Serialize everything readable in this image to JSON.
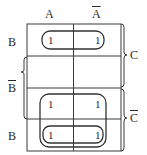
{
  "diagram": {
    "type": "karnaugh-map",
    "columns": [
      {
        "label": "A",
        "negated": false
      },
      {
        "label": "A",
        "negated": true
      }
    ],
    "rows": [
      {
        "label": "B",
        "negated": false
      },
      {
        "label": "B",
        "negated": true
      },
      {
        "label": "",
        "negated": false
      },
      {
        "label": "B",
        "negated": false
      }
    ],
    "row_brackets": [
      {
        "side": "left",
        "label": "B",
        "negated": true,
        "rows": [
          1,
          2
        ]
      },
      {
        "side": "right",
        "label": "C",
        "negated": false,
        "rows": [
          0,
          1
        ]
      },
      {
        "side": "right",
        "label": "C",
        "negated": true,
        "rows": [
          2,
          3
        ]
      }
    ],
    "cells": [
      [
        "1",
        "1"
      ],
      [
        "",
        ""
      ],
      [
        "1",
        "1"
      ],
      [
        "1",
        "1"
      ]
    ],
    "groupings": [
      {
        "name": "row-0-pair",
        "cells": [
          [
            0,
            0
          ],
          [
            0,
            1
          ]
        ]
      },
      {
        "name": "rows-2-3-quad",
        "cells": [
          [
            2,
            0
          ],
          [
            2,
            1
          ],
          [
            3,
            0
          ],
          [
            3,
            1
          ]
        ]
      },
      {
        "name": "row-3-pair",
        "cells": [
          [
            3,
            0
          ],
          [
            3,
            1
          ]
        ]
      }
    ],
    "line_color": "#3a3a3a"
  }
}
